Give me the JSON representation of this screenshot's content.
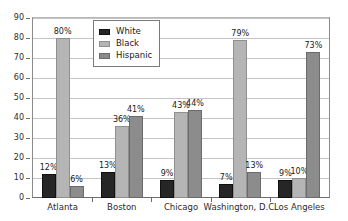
{
  "chart_data": {
    "type": "bar",
    "title": "",
    "subtitle": "",
    "xlabel": "",
    "ylabel": "",
    "ylim": [
      0,
      90
    ],
    "ytick_values": [
      0,
      10,
      20,
      30,
      40,
      50,
      60,
      70,
      80,
      90
    ],
    "ytick_labels": [
      "0",
      "10",
      "20",
      "30",
      "40",
      "50",
      "60",
      "70",
      "80",
      "90"
    ],
    "grid": true,
    "grid_axis": "y",
    "legend_position": "top-center-inside",
    "categories": [
      "Atlanta",
      "Boston",
      "Chicago",
      "Washington, D.C.",
      "Los Angeles"
    ],
    "series": [
      {
        "name": "White",
        "color": "#262626",
        "values": [
          12,
          13,
          9,
          7,
          9
        ],
        "labels": [
          "12%",
          "13%",
          "9%",
          "7%",
          "9%"
        ]
      },
      {
        "name": "Black",
        "color": "#b5b5b5",
        "values": [
          80,
          36,
          43,
          79,
          10
        ],
        "labels": [
          "80%",
          "36%",
          "43%",
          "79%",
          "10%"
        ]
      },
      {
        "name": "Hispanic",
        "color": "#8c8c8c",
        "values": [
          6,
          41,
          44,
          13,
          73
        ],
        "labels": [
          "6%",
          "41%",
          "44%",
          "13%",
          "73%"
        ]
      }
    ]
  },
  "legend": {
    "entries": [
      {
        "label": "White"
      },
      {
        "label": "Black"
      },
      {
        "label": "Hispanic"
      }
    ]
  }
}
